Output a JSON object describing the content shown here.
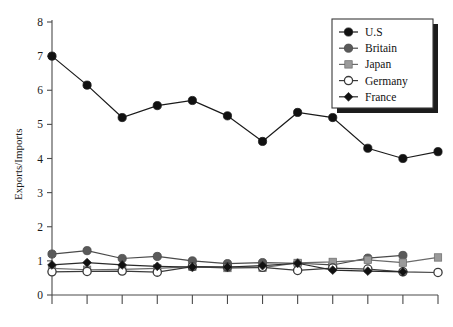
{
  "chart_data": {
    "type": "line",
    "title": "",
    "xlabel": "",
    "ylabel": "Exports/Imports",
    "ylim": [
      0,
      8
    ],
    "yticks": [
      0,
      1,
      2,
      3,
      4,
      5,
      6,
      7,
      8
    ],
    "ytick_labels": [
      "0",
      "1",
      "2",
      "3",
      "4",
      "5",
      "6",
      "7",
      "8"
    ],
    "x": [
      1,
      2,
      3,
      4,
      5,
      6,
      7,
      8,
      9,
      10,
      11,
      12
    ],
    "xtick_labels": [
      "",
      "",
      "",
      "",
      "",
      "",
      "",
      "",
      "",
      "",
      "",
      ""
    ],
    "grid": false,
    "legend_position": "top-right",
    "series": [
      {
        "name": "U.S",
        "marker": "filled-circle",
        "color": "#111111",
        "line_color": "#1a1a1a",
        "values": [
          7.0,
          6.15,
          5.2,
          5.55,
          5.7,
          5.25,
          4.5,
          5.35,
          5.2,
          4.3,
          4.0,
          4.2
        ]
      },
      {
        "name": "Britain",
        "marker": "filled-circle",
        "color": "#5a5a5a",
        "line_color": "#4a4a4a",
        "values": [
          1.2,
          1.3,
          1.07,
          1.13,
          1.0,
          0.92,
          0.95,
          0.93,
          0.88,
          1.08,
          1.16,
          null
        ]
      },
      {
        "name": "Japan",
        "marker": "filled-square",
        "color": "#9a9a9a",
        "line_color": "#6a6a6a",
        "values": [
          0.78,
          0.74,
          0.75,
          0.78,
          0.83,
          0.79,
          0.8,
          0.94,
          0.97,
          1.03,
          0.95,
          1.1
        ]
      },
      {
        "name": "Germany",
        "marker": "open-circle",
        "color": "#ffffff",
        "line_color": "#3a3a3a",
        "values": [
          0.68,
          0.69,
          0.7,
          0.67,
          0.83,
          0.82,
          0.81,
          0.72,
          0.79,
          0.76,
          0.68,
          0.66
        ]
      },
      {
        "name": "France",
        "marker": "filled-diamond",
        "color": "#111111",
        "line_color": "#2a2a2a",
        "values": [
          0.88,
          0.95,
          0.88,
          0.84,
          0.82,
          0.82,
          0.86,
          0.93,
          0.73,
          0.7,
          0.68,
          null
        ]
      }
    ]
  },
  "legend": {
    "entries": [
      {
        "label": "U.S"
      },
      {
        "label": "Britain"
      },
      {
        "label": "Japan"
      },
      {
        "label": "Germany"
      },
      {
        "label": "France"
      }
    ]
  },
  "axes": {
    "y_title": "Exports/Imports"
  }
}
